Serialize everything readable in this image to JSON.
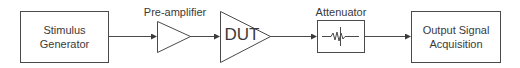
{
  "diagram": {
    "type": "signal-chain block diagram",
    "blocks": [
      {
        "id": "stimulus",
        "label_line1": "Stimulus",
        "label_line2": "Generator",
        "shape": "rectangle"
      },
      {
        "id": "preamp",
        "label": "Pre-amplifier",
        "shape": "triangle"
      },
      {
        "id": "dut",
        "label": "DUT",
        "shape": "triangle"
      },
      {
        "id": "attenuator",
        "label": "Attenuator",
        "shape": "rectangle",
        "icon": "resistor-icon"
      },
      {
        "id": "output",
        "label_line1": "Output Signal",
        "label_line2": "Acquisition",
        "shape": "rectangle"
      }
    ],
    "connections": [
      [
        "stimulus",
        "preamp"
      ],
      [
        "preamp",
        "dut"
      ],
      [
        "dut",
        "attenuator"
      ],
      [
        "attenuator",
        "output"
      ]
    ],
    "colors": {
      "stroke": "#4a4a4a",
      "text": "#3a3a3a",
      "background": "#ffffff"
    }
  }
}
